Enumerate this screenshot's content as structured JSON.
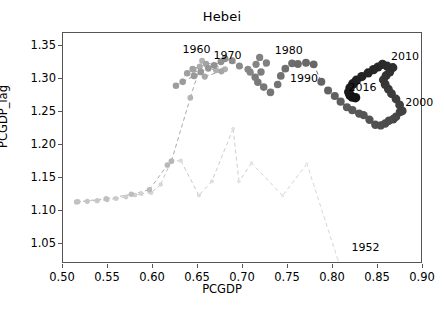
{
  "chart_data": {
    "type": "scatter",
    "title": "Hebei",
    "xlabel": "PCGDP",
    "ylabel": "PCGDP_lag",
    "xlim": [
      0.5,
      0.9
    ],
    "ylim": [
      1.02,
      1.37
    ],
    "xticks": [
      "0.50",
      "0.55",
      "0.60",
      "0.65",
      "0.70",
      "0.75",
      "0.80",
      "0.85",
      "0.90"
    ],
    "xtick_values": [
      0.5,
      0.55,
      0.6,
      0.65,
      0.7,
      0.75,
      0.8,
      0.85,
      0.9
    ],
    "yticks": [
      "1.05",
      "1.10",
      "1.15",
      "1.20",
      "1.25",
      "1.30",
      "1.35"
    ],
    "ytick_values": [
      1.05,
      1.1,
      1.15,
      1.2,
      1.25,
      1.3,
      1.35
    ],
    "grid": false,
    "legend": null,
    "colormap": "grayscale-light-to-dark-by-year",
    "line_style": "dashed",
    "marker": "circle",
    "series": [
      {
        "name": "Hebei trajectory",
        "x": [
          0.8055,
          0.771,
          0.744,
          0.7095,
          0.6955,
          0.689,
          0.6655,
          0.651,
          0.631,
          0.62,
          0.6085,
          0.598,
          0.587,
          0.58,
          0.57,
          0.559,
          0.549,
          0.538,
          0.527,
          0.5165,
          0.515,
          0.548,
          0.576,
          0.596,
          0.616,
          0.6205,
          0.6415,
          0.6545,
          0.68,
          0.67,
          0.652,
          0.645,
          0.6575,
          0.676,
          0.659,
          0.644,
          0.638,
          0.6255,
          0.633,
          0.6455,
          0.653,
          0.6615,
          0.668,
          0.6755,
          0.68,
          0.688,
          0.696,
          0.7055,
          0.708,
          0.7145,
          0.7185,
          0.726,
          0.72,
          0.7135,
          0.7165,
          0.723,
          0.7305,
          0.7385,
          0.742,
          0.747,
          0.7545,
          0.761,
          0.77,
          0.7785,
          0.787,
          0.7945,
          0.802,
          0.8085,
          0.8155,
          0.8215,
          0.829,
          0.834,
          0.8405,
          0.847,
          0.853,
          0.858,
          0.862,
          0.867,
          0.87,
          0.8745,
          0.877,
          0.874,
          0.87,
          0.865,
          0.8615,
          0.858,
          0.856,
          0.859,
          0.863,
          0.8665,
          0.86,
          0.855,
          0.85,
          0.845,
          0.839,
          0.832,
          0.826,
          0.822,
          0.819,
          0.8175,
          0.819,
          0.8215,
          0.825
        ],
        "y": [
          1.026,
          1.172,
          1.1235,
          1.173,
          1.145,
          1.225,
          1.1455,
          1.124,
          1.1765,
          1.1755,
          1.1405,
          1.128,
          1.1265,
          1.1245,
          1.1215,
          1.119,
          1.1175,
          1.116,
          1.115,
          1.1145,
          1.114,
          1.119,
          1.1255,
          1.1325,
          1.17,
          1.176,
          1.272,
          1.328,
          1.315,
          1.3135,
          1.319,
          1.3145,
          1.304,
          1.312,
          1.323,
          1.3155,
          1.309,
          1.29,
          1.296,
          1.305,
          1.311,
          1.3165,
          1.321,
          1.3265,
          1.331,
          1.328,
          1.32,
          1.315,
          1.3105,
          1.3225,
          1.333,
          1.3245,
          1.311,
          1.303,
          1.2955,
          1.288,
          1.28,
          1.292,
          1.305,
          1.316,
          1.324,
          1.323,
          1.325,
          1.3225,
          1.296,
          1.283,
          1.2745,
          1.266,
          1.2575,
          1.253,
          1.248,
          1.2455,
          1.2385,
          1.231,
          1.23,
          1.233,
          1.237,
          1.2395,
          1.243,
          1.2505,
          1.252,
          1.261,
          1.27,
          1.278,
          1.285,
          1.292,
          1.299,
          1.3055,
          1.311,
          1.3175,
          1.32,
          1.3225,
          1.3185,
          1.3145,
          1.3095,
          1.304,
          1.2985,
          1.293,
          1.287,
          1.2805,
          1.2755,
          1.273,
          1.272
        ]
      }
    ],
    "annotations": [
      {
        "label": "1952",
        "x": 0.806,
        "y": 1.048,
        "dx": 28,
        "dy": 2
      },
      {
        "label": "1960",
        "x": 0.6495,
        "y": 1.345,
        "dx": 0,
        "dy": 0
      },
      {
        "label": "1970",
        "x": 0.684,
        "y": 1.3345,
        "dx": 0,
        "dy": 0
      },
      {
        "label": "1980",
        "x": 0.752,
        "y": 1.343,
        "dx": 0,
        "dy": 0
      },
      {
        "label": "1990",
        "x": 0.769,
        "y": 1.301,
        "dx": 0,
        "dy": 0
      },
      {
        "label": "2000",
        "x": 0.897,
        "y": 1.264,
        "dx": 0,
        "dy": 0
      },
      {
        "label": "2010",
        "x": 0.881,
        "y": 1.333,
        "dx": 0,
        "dy": 0
      },
      {
        "label": "2016",
        "x": 0.834,
        "y": 1.2865,
        "dx": 0,
        "dy": 0
      }
    ]
  },
  "style": {
    "axis_color": "#555555",
    "text_color": "#000000",
    "background": "#ffffff",
    "point_light": "#e8e8e8",
    "point_dark": "#141414",
    "line_color": "#9a9a9a"
  }
}
